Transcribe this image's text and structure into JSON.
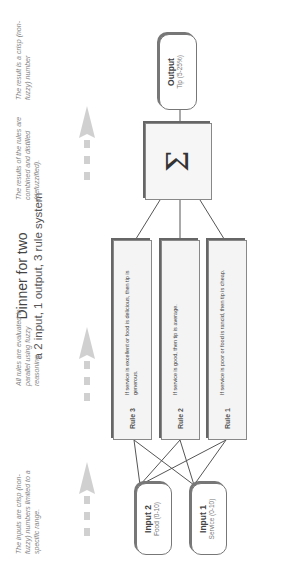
{
  "diagram": {
    "title": "Dinner for two",
    "subtitle": "a 2 input, 1 output, 3 rule system",
    "orientation": "rotated 90 degrees counterclockwise",
    "inputs": [
      {
        "label": "Input 1",
        "sub": "Service (0-10)"
      },
      {
        "label": "Input 2",
        "sub": "Food (0-10)"
      }
    ],
    "rules": [
      {
        "label": "Rule 1",
        "text": "If service is poor or food is rancid, then tip is cheap."
      },
      {
        "label": "Rule 2",
        "text": "If service is good, then tip is average."
      },
      {
        "label": "Rule 3",
        "text": "If service is excellent or food is delicious, then tip is generous."
      }
    ],
    "aggregator": {
      "symbol": "Σ",
      "icon": "sigma-icon"
    },
    "output": {
      "label": "Output",
      "sub": "Tip (5-25%)"
    },
    "notes": [
      "The inputs are crisp (non-fuzzy) numbers limited to a specific range.",
      "All rules are evaluated in parallel using fuzzy reasoning",
      "The results of the rules are combined and distilled (defuzzified).",
      "The result is a crisp (non-fuzzy) number"
    ],
    "colors": {
      "line": "#555555",
      "box_fill": "#f4f4f4",
      "arrow": "#cccccc",
      "note_text": "#888888"
    }
  }
}
